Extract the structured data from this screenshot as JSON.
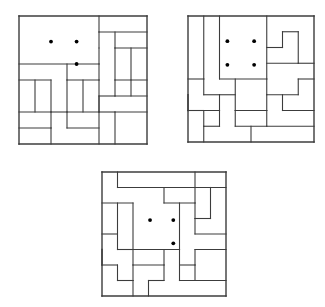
{
  "figure": {
    "type": "polyomino-dissection-puzzle-set",
    "background_color": "#ffffff",
    "line_color": "#3c3c3c",
    "dot_color": "#000000",
    "grid_cells": 8,
    "cell_size": 16,
    "stroke_width": 1.1,
    "border_stroke_width": 1.4,
    "dot_radius": 1.9
  },
  "boards": [
    {
      "id": "puzzle-1",
      "label": "Puzzle 1",
      "x": 17,
      "y": 14,
      "size": 128,
      "dots": [
        {
          "cx": 2.0,
          "cy": 1.6
        },
        {
          "cx": 3.6,
          "cy": 1.6
        },
        {
          "cx": 3.6,
          "cy": 3.0
        }
      ],
      "dot_count": 3,
      "segments": [
        [
          0,
          0,
          8,
          0
        ],
        [
          0,
          8,
          8,
          8
        ],
        [
          0,
          0,
          0,
          8
        ],
        [
          8,
          0,
          8,
          8
        ],
        [
          5,
          0,
          5,
          1
        ],
        [
          5,
          1,
          8,
          1
        ],
        [
          0,
          3,
          5,
          3
        ],
        [
          5,
          2,
          5,
          3
        ],
        [
          5,
          1,
          5,
          2
        ],
        [
          6,
          1,
          6,
          2
        ],
        [
          6,
          2,
          8,
          2
        ],
        [
          3,
          3,
          3,
          4
        ],
        [
          3,
          4,
          5,
          4
        ],
        [
          5,
          3,
          5,
          4
        ],
        [
          6,
          2,
          6,
          4
        ],
        [
          6,
          4,
          8,
          4
        ],
        [
          0,
          4,
          2,
          4
        ],
        [
          2,
          4,
          2,
          6
        ],
        [
          0,
          6,
          2,
          6
        ],
        [
          3,
          4,
          3,
          6
        ],
        [
          3,
          6,
          5,
          6
        ],
        [
          5,
          4,
          5,
          6
        ],
        [
          6,
          4,
          6,
          5
        ],
        [
          5,
          5,
          6,
          5
        ],
        [
          5,
          5,
          5,
          6
        ],
        [
          6,
          5,
          8,
          5
        ],
        [
          2,
          6,
          3,
          6
        ],
        [
          5,
          6,
          6,
          6
        ],
        [
          6,
          6,
          8,
          6
        ],
        [
          2,
          6,
          2,
          7
        ],
        [
          0,
          7,
          2,
          7
        ],
        [
          3,
          6,
          3,
          7
        ],
        [
          3,
          7,
          5,
          7
        ],
        [
          5,
          6,
          5,
          8
        ],
        [
          6,
          6,
          6,
          8
        ],
        [
          2,
          7,
          2,
          8
        ],
        [
          7,
          2,
          7,
          4
        ],
        [
          7,
          4,
          7,
          5
        ],
        [
          4,
          4,
          4,
          6
        ],
        [
          1,
          4,
          1,
          6
        ]
      ]
    },
    {
      "id": "puzzle-2",
      "label": "Puzzle 2",
      "x": 186,
      "y": 14,
      "size": 126,
      "dots": [
        {
          "cx": 2.5,
          "cy": 1.6
        },
        {
          "cx": 4.2,
          "cy": 1.6
        },
        {
          "cx": 2.5,
          "cy": 3.1
        },
        {
          "cx": 4.2,
          "cy": 3.1
        }
      ],
      "dot_count": 4,
      "segments": [
        [
          0,
          0,
          8,
          0
        ],
        [
          0,
          8,
          8,
          8
        ],
        [
          0,
          0,
          0,
          8
        ],
        [
          8,
          0,
          8,
          8
        ],
        [
          1,
          0,
          1,
          4
        ],
        [
          0,
          4,
          1,
          4
        ],
        [
          2,
          0,
          2,
          4
        ],
        [
          2,
          4,
          5,
          4
        ],
        [
          5,
          0,
          5,
          4
        ],
        [
          5,
          2,
          6,
          2
        ],
        [
          6,
          1,
          6,
          2
        ],
        [
          6,
          1,
          7,
          1
        ],
        [
          7,
          1,
          7,
          3
        ],
        [
          5,
          3,
          7,
          3
        ],
        [
          7,
          3,
          8,
          3
        ],
        [
          3,
          4,
          3,
          6
        ],
        [
          2,
          5,
          3,
          5
        ],
        [
          1,
          5,
          2,
          5
        ],
        [
          1,
          4,
          1,
          5
        ],
        [
          5,
          4,
          5,
          5
        ],
        [
          5,
          5,
          7,
          5
        ],
        [
          7,
          4,
          7,
          5
        ],
        [
          7,
          4,
          8,
          4
        ],
        [
          0,
          5,
          0,
          6
        ],
        [
          0,
          6,
          2,
          6
        ],
        [
          2,
          5,
          2,
          6
        ],
        [
          3,
          6,
          5,
          6
        ],
        [
          5,
          5,
          5,
          6
        ],
        [
          5,
          6,
          5,
          7
        ],
        [
          5,
          7,
          8,
          7
        ],
        [
          2,
          6,
          2,
          7
        ],
        [
          1,
          7,
          2,
          7
        ],
        [
          1,
          6,
          1,
          7
        ],
        [
          3,
          6,
          3,
          7
        ],
        [
          3,
          7,
          5,
          7
        ],
        [
          6,
          5,
          6,
          6
        ],
        [
          6,
          6,
          8,
          6
        ],
        [
          0,
          6,
          1,
          6
        ],
        [
          1,
          7,
          1,
          8
        ],
        [
          4,
          7,
          4,
          8
        ]
      ]
    },
    {
      "id": "puzzle-3",
      "label": "Puzzle 3",
      "x": 100,
      "y": 170,
      "size": 124,
      "dots": [
        {
          "cx": 3.1,
          "cy": 3.1
        },
        {
          "cx": 4.6,
          "cy": 3.1
        },
        {
          "cx": 4.6,
          "cy": 4.6
        }
      ],
      "dot_count": 3,
      "segments": [
        [
          0,
          0,
          8,
          0
        ],
        [
          0,
          8,
          8,
          8
        ],
        [
          0,
          0,
          0,
          8
        ],
        [
          8,
          0,
          8,
          8
        ],
        [
          1,
          0,
          1,
          1
        ],
        [
          1,
          1,
          6,
          1
        ],
        [
          6,
          0,
          6,
          1
        ],
        [
          6,
          1,
          6,
          2
        ],
        [
          4,
          2,
          6,
          2
        ],
        [
          4,
          1,
          4,
          2
        ],
        [
          6,
          1,
          8,
          1
        ],
        [
          7,
          1,
          7,
          3
        ],
        [
          6,
          3,
          7,
          3
        ],
        [
          6,
          2,
          6,
          3
        ],
        [
          0,
          2,
          2,
          2
        ],
        [
          2,
          2,
          2,
          5
        ],
        [
          5,
          2,
          5,
          5
        ],
        [
          2,
          5,
          5,
          5
        ],
        [
          6,
          3,
          6,
          4
        ],
        [
          6,
          4,
          8,
          4
        ],
        [
          0,
          4,
          1,
          4
        ],
        [
          1,
          4,
          1,
          5
        ],
        [
          1,
          5,
          2,
          5
        ],
        [
          0,
          5,
          0,
          6
        ],
        [
          0,
          6,
          1,
          6
        ],
        [
          1,
          6,
          1,
          7
        ],
        [
          1,
          7,
          2,
          7
        ],
        [
          2,
          5,
          2,
          6
        ],
        [
          2,
          6,
          4,
          6
        ],
        [
          4,
          5,
          4,
          6
        ],
        [
          4,
          6,
          4,
          7
        ],
        [
          3,
          7,
          4,
          7
        ],
        [
          3,
          7,
          3,
          8
        ],
        [
          5,
          5,
          5,
          6
        ],
        [
          5,
          6,
          6,
          6
        ],
        [
          6,
          5,
          6,
          6
        ],
        [
          6,
          5,
          8,
          5
        ],
        [
          6,
          6,
          6,
          7
        ],
        [
          5,
          7,
          8,
          7
        ],
        [
          5,
          6,
          5,
          7
        ],
        [
          2,
          7,
          2,
          8
        ],
        [
          2,
          6,
          2,
          7
        ],
        [
          1,
          2,
          1,
          4
        ]
      ]
    }
  ]
}
